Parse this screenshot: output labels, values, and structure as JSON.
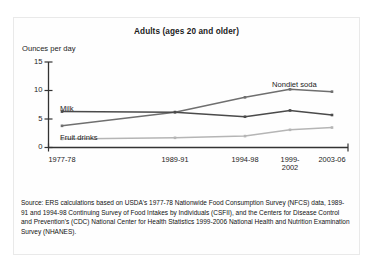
{
  "chart_data": {
    "type": "line",
    "title": "Adults (ages 20 and older)",
    "ylabel": "Ounces per day",
    "xlabel": "",
    "categories": [
      "1977-78",
      "1989-91",
      "1994-98",
      "1999-2002",
      "2003-06"
    ],
    "ytick_labels": [
      "0",
      "5",
      "10",
      "15"
    ],
    "ytick_values": [
      0,
      5,
      10,
      15
    ],
    "ylim": [
      0,
      15
    ],
    "grid": false,
    "legend_position": "inline-labels",
    "series": [
      {
        "name": "Nondiet soda",
        "color": "#6f6f6f",
        "values": [
          3.8,
          6.2,
          8.8,
          10.2,
          9.8
        ]
      },
      {
        "name": "Milk",
        "color": "#4a4a4a",
        "values": [
          6.3,
          6.2,
          5.4,
          6.5,
          5.7
        ]
      },
      {
        "name": "Fruit drinks",
        "color": "#b5b5b5",
        "values": [
          1.5,
          1.7,
          2.0,
          3.1,
          3.5
        ]
      }
    ],
    "source": "Source: ERS calculations based on USDA's 1977-78 Nationwide Food Consumption Survey (NFCS) data, 1989-91 and 1994-98 Continuing Survey of Food Intakes by Individuals (CSFII), and the Centers for Disease Control and Prevention's (CDC) National Center for Health Statistics 1999-2006 National Health and Nutrition Examination Survey (NHANES)."
  }
}
